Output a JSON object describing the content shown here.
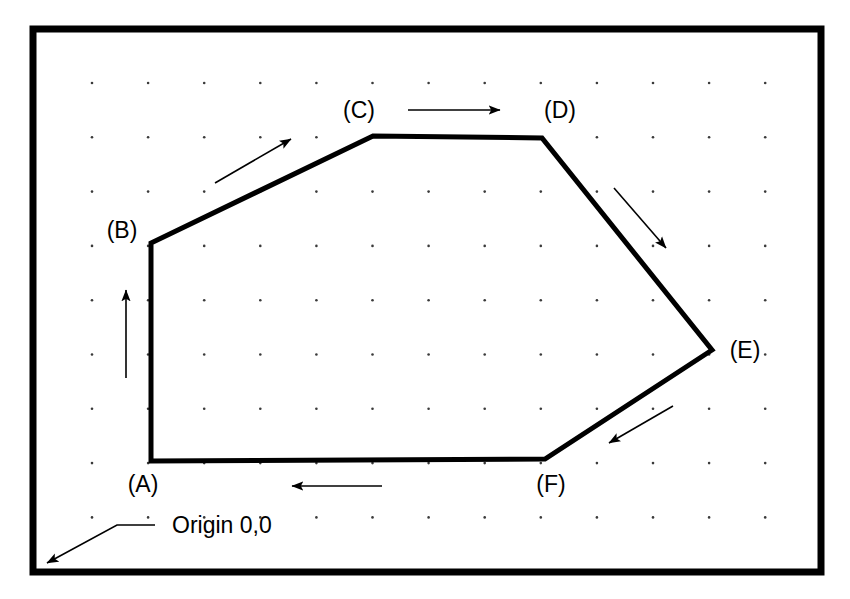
{
  "diagram": {
    "colors": {
      "stroke": "#000000",
      "background": "#ffffff",
      "grid_dot": "#3a3a3a"
    },
    "canvas": {
      "width": 850,
      "height": 599
    },
    "border": {
      "x": 33,
      "y": 29,
      "width": 788,
      "height": 543,
      "stroke_width": 7
    },
    "grid": {
      "origin_x": 92,
      "origin_y": 83,
      "spacing_x": 56.1,
      "spacing_y": 54.3,
      "cols": 13,
      "rows": 9,
      "dot_radius": 1.3
    },
    "polygon": {
      "closed": true,
      "stroke_width": 5,
      "vertices": [
        {
          "id": "A",
          "label": "(A)",
          "x": 151,
          "y": 461,
          "label_x": 143,
          "label_y": 492,
          "label_anchor": "middle"
        },
        {
          "id": "B",
          "label": "(B)",
          "x": 151,
          "y": 243,
          "label_x": 122,
          "label_y": 238,
          "label_anchor": "middle"
        },
        {
          "id": "C",
          "label": "(C)",
          "x": 373,
          "y": 136,
          "label_x": 359,
          "label_y": 118,
          "label_anchor": "middle"
        },
        {
          "id": "D",
          "label": "(D)",
          "x": 542,
          "y": 138,
          "label_x": 560,
          "label_y": 118,
          "label_anchor": "middle"
        },
        {
          "id": "E",
          "label": "(E)",
          "x": 712,
          "y": 350,
          "label_x": 745,
          "label_y": 358,
          "label_anchor": "middle"
        },
        {
          "id": "F",
          "label": "(F)",
          "x": 545,
          "y": 459,
          "label_x": 551,
          "label_y": 492,
          "label_anchor": "middle"
        }
      ]
    },
    "direction_arrows": [
      {
        "id": "arrow-A-to-B",
        "segment": "A-B",
        "direction": "up",
        "x1": 126,
        "y1": 378,
        "x2": 126,
        "y2": 290
      },
      {
        "id": "arrow-B-to-C",
        "segment": "B-C",
        "direction": "up-right",
        "x1": 215,
        "y1": 183,
        "x2": 291,
        "y2": 139
      },
      {
        "id": "arrow-C-to-D",
        "segment": "C-D",
        "direction": "right",
        "x1": 408,
        "y1": 110,
        "x2": 500,
        "y2": 110
      },
      {
        "id": "arrow-D-to-E",
        "segment": "D-E",
        "direction": "down-right",
        "x1": 614,
        "y1": 188,
        "x2": 666,
        "y2": 248
      },
      {
        "id": "arrow-E-to-F",
        "segment": "E-F",
        "direction": "down-left",
        "x1": 673,
        "y1": 406,
        "x2": 609,
        "y2": 443
      },
      {
        "id": "arrow-F-to-A",
        "segment": "F-A",
        "direction": "left",
        "x1": 382,
        "y1": 486,
        "x2": 292,
        "y2": 486
      }
    ],
    "annotation": {
      "origin_label": "Origin 0,0",
      "label_x": 172,
      "label_y": 533,
      "leader": {
        "horizontal_from_x": 155,
        "horizontal_y": 525,
        "bend_x": 117,
        "arrow_tip_x": 47,
        "arrow_tip_y": 563
      }
    }
  }
}
